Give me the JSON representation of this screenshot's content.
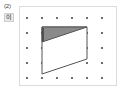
{
  "labels": {
    "problem_number": "(2)",
    "item_marker": "이"
  },
  "figure": {
    "name": "dot-grid-quadrilateral-figure",
    "frame": {
      "x": 19,
      "y": 6,
      "width": 98,
      "height": 80
    },
    "grid": {
      "columns": 6,
      "rows": 5,
      "spacing_x": 15,
      "spacing_y": 15,
      "origin_x": 7,
      "origin_y": 11,
      "dot_radius": 1.1,
      "dot_color": "#4a4a4a"
    },
    "quadrilateral": {
      "name": "main-quadrilateral",
      "points": "22,20 67,20 67,52 22,67",
      "stroke": "#555555",
      "stroke_width": 1,
      "fill": "#ffffff"
    },
    "shaded_triangle": {
      "name": "shaded-triangle",
      "points": "22,20 67,20 22,35",
      "fill": "#8a8a8a",
      "stroke": "#555555",
      "stroke_width": 1
    },
    "tick_mark": {
      "name": "left-edge-tick",
      "x1": 23,
      "y1": 21,
      "x2": 23,
      "y2": 34,
      "stroke": "#3c3c3c",
      "stroke_width": 1.4
    }
  },
  "chart_data": {
    "type": "scatter",
    "title": "",
    "xlabel": "",
    "ylabel": "",
    "grid": true,
    "legend_position": "none",
    "categories": [
      "col1",
      "col2",
      "col3",
      "col4",
      "col5",
      "col6"
    ],
    "x": [
      0,
      1,
      2,
      3,
      4,
      5
    ],
    "y": [
      0,
      1,
      2,
      3,
      4
    ],
    "series": [
      {
        "name": "dot-grid-row-1",
        "values": [
          1,
          1,
          1,
          1,
          1,
          1
        ]
      },
      {
        "name": "dot-grid-row-2",
        "values": [
          1,
          1,
          1,
          1,
          1,
          1
        ]
      },
      {
        "name": "dot-grid-row-3",
        "values": [
          1,
          1,
          1,
          1,
          1,
          1
        ]
      },
      {
        "name": "dot-grid-row-4",
        "values": [
          1,
          1,
          1,
          1,
          1,
          1
        ]
      },
      {
        "name": "dot-grid-row-5",
        "values": [
          1,
          1,
          1,
          1,
          1,
          1
        ]
      }
    ],
    "annotations": [
      {
        "label": "(2)",
        "x": 0,
        "y": 0
      }
    ]
  }
}
